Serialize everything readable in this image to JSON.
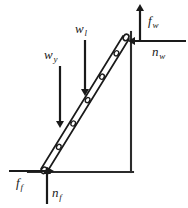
{
  "figure": {
    "type": "free-body-diagram",
    "ink_color": "#1a1a1a",
    "background_color": "#ffffff"
  },
  "labels": {
    "f_w": {
      "base": "f",
      "sub": "w"
    },
    "n_w": {
      "base": "n",
      "sub": "w"
    },
    "w_l": {
      "base": "w",
      "sub": "l"
    },
    "w_y": {
      "base": "w",
      "sub": "y"
    },
    "f_f": {
      "base": "f",
      "sub": "f"
    },
    "n_f": {
      "base": "n",
      "sub": "f"
    }
  },
  "forces": [
    {
      "name": "f_w",
      "direction": "up",
      "location": "top of ladder at wall"
    },
    {
      "name": "n_w",
      "direction": "left",
      "location": "top of ladder at wall"
    },
    {
      "name": "w_l",
      "direction": "down",
      "location": "upper middle of ladder"
    },
    {
      "name": "w_y",
      "direction": "down",
      "location": "lower middle of ladder"
    },
    {
      "name": "f_f",
      "direction": "right",
      "location": "base of ladder on ground"
    },
    {
      "name": "n_f",
      "direction": "up",
      "location": "base of ladder on ground"
    }
  ],
  "structure": {
    "wall": "vertical line on the right",
    "ground": "horizontal line along the bottom",
    "ladder": "two parallel rails inclined from lower-left to upper-right with rungs",
    "rung_count": 5
  }
}
